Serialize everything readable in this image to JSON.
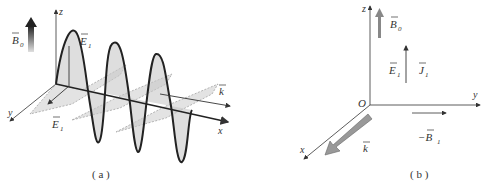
{
  "panel_a": {
    "caption": "( a )",
    "labels": {
      "b0": "B",
      "b0_sub": "0",
      "z_axis": "z",
      "e1_top": "E",
      "e1_top_sub": "1",
      "y_axis": "y",
      "e1_bottom": "E",
      "e1_bottom_sub": "1",
      "k": "k",
      "x_axis": "x"
    },
    "description": "Electric field wave E1 oscillating in the xz-plane (solid, shaded) and dashed magnetic wave in the xy-plane, propagating along x with wave vector k; static field B0 along z."
  },
  "panel_b": {
    "caption": "( b )",
    "labels": {
      "z_axis": "z",
      "b0": "B",
      "b0_sub": "0",
      "e1": "E",
      "e1_sub": "1",
      "j1": "J",
      "j1_sub": "1",
      "origin": "O",
      "y_axis": "y",
      "neg_b1": "−B",
      "neg_b1_sub": "1",
      "k": "k",
      "x_axis": "x"
    },
    "description": "Coordinate frame with B0 along z, E1 and J1 along z, −B1 along y, and wave vector k along x."
  },
  "colors": {
    "line": "#333333",
    "wave_fill": "#c8c8c8",
    "dashed_fill": "#dcdcdc",
    "thick_arrow": "#888888"
  }
}
